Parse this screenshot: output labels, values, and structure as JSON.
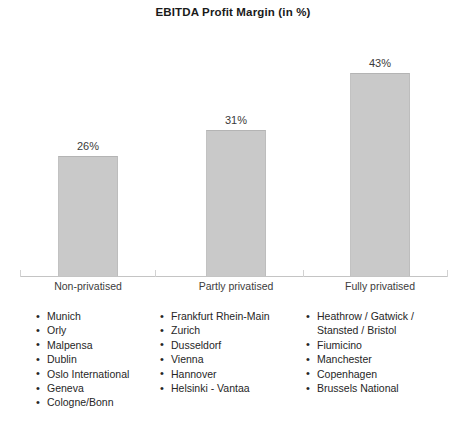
{
  "chart_data": {
    "type": "bar",
    "title": "EBITDA Profit Margin (in %)",
    "xlabel": "",
    "ylabel": "",
    "ylim": [
      0,
      50
    ],
    "grid": false,
    "legend": "none",
    "categories": [
      "Non-privatised",
      "Partly privatised",
      "Fully privatised"
    ],
    "values": [
      26,
      31,
      43
    ],
    "data_labels": [
      "26%",
      "31%",
      "43%"
    ],
    "bar_color": "#c9c9c9",
    "axis_color": "#c4c4c4",
    "annotations": {
      "groups": [
        {
          "category": "Non-privatised",
          "airports": [
            "Munich",
            "Orly",
            "Malpensa",
            "Dublin",
            "Oslo International",
            "Geneva",
            "Cologne/Bonn"
          ]
        },
        {
          "category": "Partly privatised",
          "airports": [
            "Frankfurt Rhein-Main",
            "Zurich",
            "Dusseldorf",
            "Vienna",
            "Hannover",
            "Helsinki - Vantaa"
          ]
        },
        {
          "category": "Fully privatised",
          "airports": [
            "Heathrow / Gatwick /\nStansted / Bristol",
            "Fiumicino",
            "Manchester",
            "Copenhagen",
            "Brussels National"
          ]
        }
      ]
    }
  }
}
